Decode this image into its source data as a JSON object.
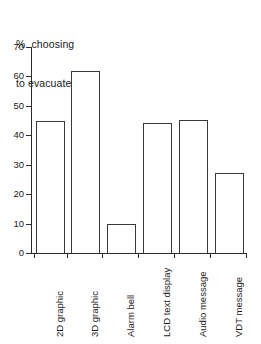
{
  "chart_data": {
    "type": "bar",
    "title": "% choosing to evacuate",
    "title_lines": [
      "%  choosing",
      "to evacuate"
    ],
    "xlabel": "",
    "ylabel": "% choosing to evacuate",
    "ylim": [
      0,
      70
    ],
    "yticks": [
      0,
      10,
      20,
      30,
      40,
      50,
      60,
      70
    ],
    "ytick_labels": [
      "0",
      "10",
      "20",
      "30",
      "40",
      "50",
      "60",
      "70"
    ],
    "grid": false,
    "legend": false,
    "categories": [
      "2D graphic",
      "3D graphic",
      "Alarm bell",
      "LCD text display",
      "Audio message",
      "VDT message"
    ],
    "values": [
      45.0,
      62.0,
      10.0,
      44.2,
      45.3,
      27.3
    ],
    "bar_facecolor": "#ffffff",
    "bar_edgecolor": "#3a3a3a",
    "axis_color": "#2b2b2b",
    "text_color": "#1a1a1a",
    "background": "#ffffff"
  }
}
